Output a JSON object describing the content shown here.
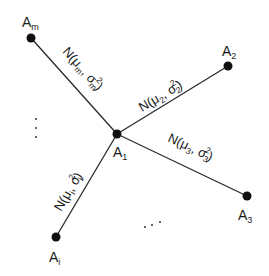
{
  "diagram": {
    "type": "star-graph",
    "center": {
      "id": "A1",
      "base": "A",
      "sub": "1",
      "x": 117,
      "y": 134
    },
    "nodes": [
      {
        "id": "Am",
        "base": "A",
        "sub": "m",
        "x": 31,
        "y": 38,
        "label_x": 22,
        "label_y": 24
      },
      {
        "id": "A2",
        "base": "A",
        "sub": "2",
        "x": 228,
        "y": 66,
        "label_x": 222,
        "label_y": 55
      },
      {
        "id": "A3",
        "base": "A",
        "sub": "3",
        "x": 247,
        "y": 196,
        "label_x": 240,
        "label_y": 220
      },
      {
        "id": "Ai",
        "base": "A",
        "sub": "i",
        "x": 56,
        "y": 237,
        "label_x": 49,
        "label_y": 262
      }
    ],
    "center_label": {
      "base": "A",
      "sub": "1",
      "x": 113,
      "y": 155
    },
    "edges": [
      {
        "to": "Am",
        "label_prefix": "N(μ",
        "mu_sub": "m",
        "sep": ", σ",
        "sigma_sub": "m",
        "sigma_sup": "2",
        "label_suffix": ")"
      },
      {
        "to": "A2",
        "label_prefix": "N(μ",
        "mu_sub": "2",
        "sep": ", σ",
        "sigma_sub": "2",
        "sigma_sup": "2",
        "label_suffix": ")"
      },
      {
        "to": "A3",
        "label_prefix": "N(μ",
        "mu_sub": "3",
        "sep": ", σ",
        "sigma_sub": "3",
        "sigma_sup": "2",
        "label_suffix": ")"
      },
      {
        "to": "Ai",
        "label_prefix": "N(μ",
        "mu_sub": "i",
        "sep": ", σ",
        "sigma_sub": "i",
        "sigma_sup": "2",
        "label_suffix": ")"
      }
    ],
    "ellipses": [
      {
        "orientation": "vertical",
        "text": "⋮",
        "dots": [
          [
            36,
            118
          ],
          [
            36,
            128
          ],
          [
            36,
            138
          ]
        ]
      },
      {
        "orientation": "horizontal",
        "text": "…",
        "dots": [
          [
            145,
            227
          ],
          [
            152,
            225
          ],
          [
            160,
            222
          ]
        ]
      }
    ],
    "colors": {
      "line": "#2a2a2a",
      "node": "#111111",
      "text": "#1a1a1a",
      "background": "#ffffff"
    }
  }
}
